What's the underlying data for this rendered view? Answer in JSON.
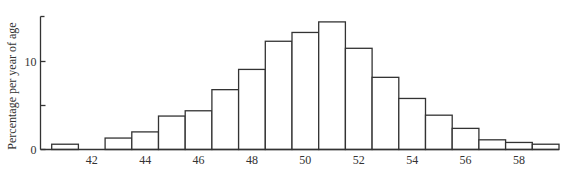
{
  "chart_data": {
    "type": "bar",
    "title": "",
    "xlabel": "",
    "ylabel": "Percentage per year of age",
    "categories": [
      41,
      42,
      43,
      44,
      45,
      46,
      47,
      48,
      49,
      50,
      51,
      52,
      53,
      54,
      55,
      56,
      57,
      58,
      59
    ],
    "values": [
      0.6,
      0,
      1.3,
      2.0,
      3.8,
      4.4,
      6.8,
      9.1,
      12.3,
      13.3,
      14.5,
      11.5,
      8.2,
      5.8,
      3.9,
      2.4,
      1.1,
      0.8,
      0.6
    ],
    "x_tick_labels": [
      "42",
      "44",
      "46",
      "48",
      "50",
      "52",
      "54",
      "56",
      "58"
    ],
    "x_tick_values": [
      42,
      44,
      46,
      48,
      50,
      52,
      54,
      56,
      58
    ],
    "y_tick_labels": [
      "0",
      "10"
    ],
    "y_tick_values": [
      0,
      10
    ],
    "y_minor_ticks": [
      5,
      15
    ],
    "ylim": [
      0,
      15
    ],
    "xlim": [
      40.5,
      59.5
    ],
    "grid": false,
    "legend": null,
    "colors": {
      "bar_fill": "#ffffff",
      "bar_stroke": "#333333",
      "text": "#333333"
    }
  }
}
